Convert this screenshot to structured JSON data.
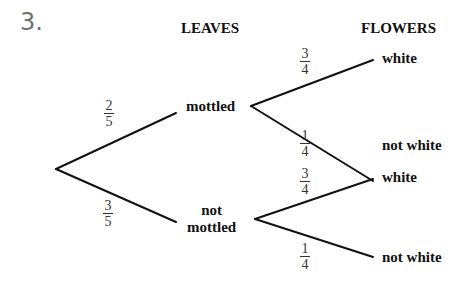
{
  "question_number": "3.",
  "headers": {
    "leaves": "LEAVES",
    "flowers": "FLOWERS"
  },
  "nodes": {
    "mottled": "mottled",
    "not_mottled_line1": "not",
    "not_mottled_line2": "mottled"
  },
  "outcomes": [
    {
      "label": "white"
    },
    {
      "label": "not white"
    },
    {
      "label": "white"
    },
    {
      "label": "not white"
    }
  ],
  "probabilities": {
    "mottled": {
      "num": "2",
      "den": "5"
    },
    "not_mottled": {
      "num": "3",
      "den": "5"
    },
    "mottled_white": {
      "num": "3",
      "den": "4"
    },
    "mottled_not_white": {
      "num": "1",
      "den": "4"
    },
    "not_mottled_white": {
      "num": "3",
      "den": "4"
    },
    "not_mottled_not_white": {
      "num": "1",
      "den": "4"
    }
  },
  "colors": {
    "line": "#111111",
    "question_number": "#707070"
  }
}
